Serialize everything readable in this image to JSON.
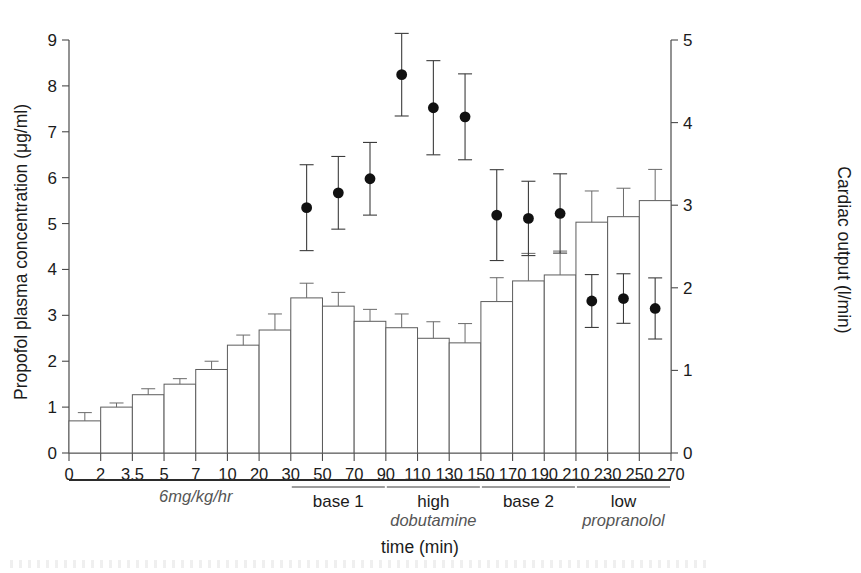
{
  "chart_data": {
    "type": "bar",
    "title": "",
    "xlabel": "time (min)",
    "ylabel": "Propofol plasma concentration (μg/ml)",
    "y2label": "Cardiac output (l/min)",
    "grid": false,
    "legend_position": "none",
    "xlim": [
      0,
      20
    ],
    "ylim": [
      0,
      9
    ],
    "y2lim": [
      0,
      5
    ],
    "yticks": [
      "0",
      "1",
      "2",
      "3",
      "4",
      "5",
      "6",
      "7",
      "8",
      "9"
    ],
    "y2ticks": [
      "0",
      "1",
      "2",
      "3",
      "4",
      "5"
    ],
    "categories": [
      "0",
      "2",
      "3.5",
      "5",
      "7",
      "10",
      "20",
      "30",
      "50",
      "70",
      "90",
      "110",
      "130",
      "150",
      "170",
      "190",
      "210",
      "230",
      "250",
      "270"
    ],
    "series": [
      {
        "name": "Propofol plasma concentration",
        "axis": "left",
        "units": "μg/ml",
        "render": "bar",
        "values": [
          null,
          0.7,
          1.0,
          1.27,
          1.5,
          1.82,
          2.35,
          2.68,
          3.38,
          3.2,
          2.87,
          2.73,
          2.5,
          2.4,
          3.3,
          3.75,
          3.88,
          5.03,
          5.15,
          5.5
        ],
        "errors": [
          null,
          0.18,
          0.09,
          0.13,
          0.12,
          0.18,
          0.22,
          0.35,
          0.32,
          0.3,
          0.26,
          0.3,
          0.36,
          0.42,
          0.52,
          0.6,
          0.52,
          0.68,
          0.62,
          0.68
        ]
      },
      {
        "name": "Cardiac output",
        "axis": "right",
        "units": "l/min",
        "render": "point-errorbar",
        "values": [
          null,
          null,
          null,
          null,
          null,
          null,
          null,
          null,
          2.97,
          3.15,
          3.32,
          4.58,
          4.18,
          4.07,
          2.88,
          2.84,
          2.9,
          1.84,
          1.87,
          1.75
        ],
        "errors": [
          null,
          null,
          null,
          null,
          null,
          null,
          null,
          null,
          0.52,
          0.44,
          0.44,
          0.5,
          0.57,
          0.52,
          0.55,
          0.45,
          0.48,
          0.32,
          0.3,
          0.37
        ]
      }
    ],
    "annotations": {
      "infusion_label": "6mg/kg/hr",
      "groups": [
        {
          "label": "base 1",
          "from": "50",
          "to": "90"
        },
        {
          "label": "high",
          "drug": "dobutamine",
          "from": "110",
          "to": "150"
        },
        {
          "label": "base 2",
          "from": "170",
          "to": "210"
        },
        {
          "label": "low",
          "drug": "propranolol",
          "from": "230",
          "to": "270"
        }
      ]
    }
  },
  "colors": {
    "marker": "#111111",
    "bar_stroke": "#5c5c5c",
    "bar_fill": "#ffffff",
    "axis": "#3a3a3a",
    "drug_text": "#555555"
  }
}
